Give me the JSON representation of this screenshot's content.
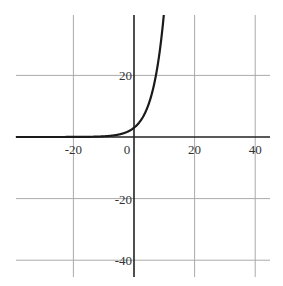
{
  "chart_data": {
    "type": "line",
    "title": "",
    "xlabel": "",
    "ylabel": "",
    "function": "y = 3(1.3)^x",
    "xlim": [
      -39,
      45
    ],
    "ylim": [
      -45,
      40
    ],
    "grid": true,
    "x_ticks": [
      -20,
      0,
      20,
      40
    ],
    "x_tick_labels": [
      "-20",
      "0",
      "20",
      "40"
    ],
    "y_ticks": [
      20,
      -20,
      -40
    ],
    "y_tick_labels": [
      "20",
      "-20",
      "-40"
    ],
    "series": [
      {
        "name": "exponential",
        "x": [
          -39,
          -30,
          -20,
          -15,
          -10,
          -5,
          0,
          2,
          4,
          6,
          7.2,
          8,
          9,
          10
        ],
        "y": [
          0.0,
          0.0,
          0.01,
          0.06,
          0.22,
          0.81,
          3.0,
          5.07,
          8.57,
          14.48,
          20.0,
          24.47,
          31.81,
          41.35
        ]
      }
    ],
    "colors": {
      "curve": "#1a1a1a",
      "axis": "#222222",
      "grid": "#aaaaaa"
    }
  }
}
